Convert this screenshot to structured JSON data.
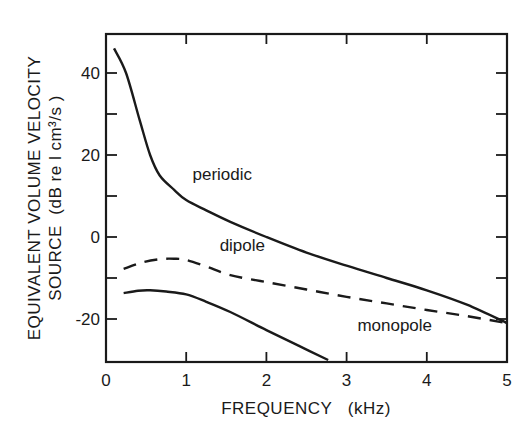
{
  "chart_data": {
    "type": "line",
    "title": "",
    "xlabel": "FREQUENCY   (kHz)",
    "ylabel_line1": "EQUIVALENT VOLUME VELOCITY",
    "ylabel_line2": "SOURCE  (dB re l cm³/s )",
    "xlim": [
      0,
      5
    ],
    "ylim": [
      -30,
      50
    ],
    "x_ticks": [
      0,
      1,
      2,
      3,
      4,
      5
    ],
    "x_tick_labels": [
      "0",
      "1",
      "2",
      "3",
      "4",
      "5"
    ],
    "y_ticks_labeled": [
      40,
      20,
      0,
      -20
    ],
    "y_tick_labels": [
      "40",
      "20",
      "0",
      "-20"
    ],
    "y_ticks_minor": [
      30,
      10,
      -10
    ],
    "grid": false,
    "legend": "inline curve labels",
    "series": [
      {
        "name": "periodic",
        "style": "solid",
        "x": [
          0.1,
          0.25,
          0.42,
          0.55,
          0.67,
          0.85,
          1.0,
          1.25,
          1.55,
          2.0,
          2.5,
          3.0,
          3.5,
          4.0,
          4.5,
          5.0
        ],
        "y": [
          46,
          40,
          28.5,
          20,
          15,
          11.5,
          9,
          6.5,
          3.7,
          0,
          -3.8,
          -7,
          -10,
          -13,
          -16.5,
          -21
        ]
      },
      {
        "name": "dipole",
        "style": "dashed",
        "x": [
          0.22,
          0.45,
          0.67,
          0.85,
          1.0,
          1.25,
          1.55,
          2.0,
          2.5,
          3.0,
          3.5,
          4.0,
          4.5,
          5.0
        ],
        "y": [
          -7.8,
          -6.2,
          -5.4,
          -5.3,
          -5.6,
          -7.2,
          -9.3,
          -11,
          -12.8,
          -14.6,
          -16.2,
          -17.8,
          -19.3,
          -21
        ]
      },
      {
        "name": "monopole",
        "style": "solid",
        "x": [
          0.22,
          0.4,
          0.55,
          0.75,
          1.0,
          1.25,
          1.55,
          2.0,
          2.4,
          2.77
        ],
        "y": [
          -13.7,
          -13.1,
          -13,
          -13.3,
          -14,
          -15.8,
          -18.3,
          -22.7,
          -26.5,
          -30
        ]
      }
    ],
    "annotations": [
      {
        "text": "periodic",
        "x": 1.45,
        "y": 14
      },
      {
        "text": "dipole",
        "x": 1.7,
        "y": -3.5
      },
      {
        "text": "monopole",
        "x": 3.6,
        "y": -23
      }
    ]
  }
}
